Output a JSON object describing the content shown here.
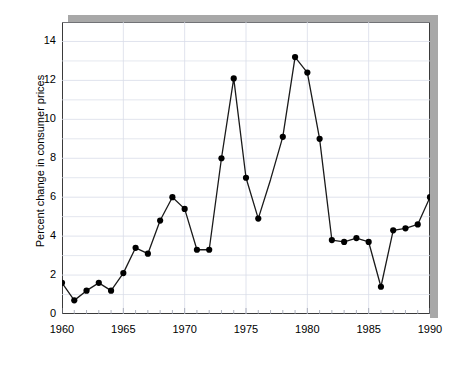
{
  "chart_data": {
    "type": "line",
    "title": "",
    "xlabel": "",
    "ylabel": "Percent change in consumer prices",
    "xlim": [
      1960,
      1990
    ],
    "ylim": [
      0,
      15
    ],
    "ytick_labels": [
      "0",
      "2",
      "4",
      "6",
      "8",
      "10",
      "12",
      "14"
    ],
    "ytick_values": [
      0,
      2,
      4,
      6,
      8,
      10,
      12,
      14
    ],
    "xtick_labels": [
      "1960",
      "1965",
      "1970",
      "1975",
      "1980",
      "1985",
      "1990"
    ],
    "xtick_values": [
      1960,
      1965,
      1970,
      1975,
      1980,
      1985,
      1990
    ],
    "grid": true,
    "grid_minor_y": true,
    "legend": "none",
    "marker": "filled-circle",
    "line_color": "#1a1a1a",
    "marker_color": "#000000",
    "grid_color": "#d8dce8",
    "frame_color": "#3a3a3a",
    "shadow_color": "#a8a8a8",
    "x": [
      1960,
      1961,
      1962,
      1963,
      1964,
      1965,
      1966,
      1967,
      1968,
      1969,
      1970,
      1971,
      1972,
      1973,
      1974,
      1975,
      1976,
      1977,
      1978,
      1979,
      1980,
      1981,
      1982,
      1983,
      1984,
      1985,
      1986,
      1987,
      1988,
      1989,
      1990
    ],
    "values": [
      1.6,
      0.7,
      1.2,
      1.6,
      1.2,
      2.1,
      3.4,
      3.1,
      4.8,
      6.0,
      5.4,
      3.3,
      3.3,
      8.0,
      12.1,
      7.0,
      4.9,
      6.9,
      9.1,
      13.2,
      12.4,
      9.0,
      3.8,
      3.7,
      3.9,
      3.7,
      1.4,
      4.3,
      4.4,
      4.6,
      6.0
    ],
    "markers_hidden_at_x": [
      1977
    ]
  }
}
